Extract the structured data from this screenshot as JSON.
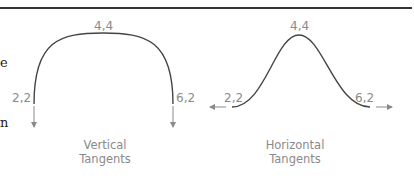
{
  "left_margin_fragments": [
    "e",
    "n"
  ],
  "diagrams": [
    {
      "id": "vertical",
      "points": {
        "start": "2,2",
        "apex": "4,4",
        "end": "6,2"
      },
      "caption_lines": [
        "Vertical",
        "Tangents"
      ]
    },
    {
      "id": "horizontal",
      "points": {
        "start": "2,2",
        "apex": "4,4",
        "end": "6,2"
      },
      "caption_lines": [
        "Horizontal",
        "Tangents"
      ]
    }
  ],
  "colors": {
    "rule": "#333333",
    "curve": "#444444",
    "label": "#8a8a8a",
    "arrow": "#8a8a8a"
  }
}
